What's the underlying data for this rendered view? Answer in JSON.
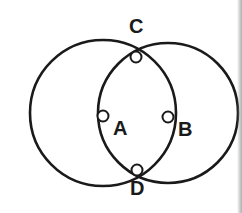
{
  "figure": {
    "background_color": "#ffffff",
    "stroke_color": "#1a1a1a",
    "marker_fill_color": "#ffffff",
    "label_color": "#1a1a1a",
    "width": 242,
    "height": 213
  },
  "circles": [
    {
      "name": "left-circle",
      "center_label": "A",
      "cx": 103,
      "cy": 113,
      "r": 73,
      "stroke_width": 2.6
    },
    {
      "name": "right-circle",
      "center_label": "B",
      "cx": 168,
      "cy": 113,
      "r": 70,
      "stroke_width": 2.6
    }
  ],
  "points": [
    {
      "id": "A",
      "label": "A",
      "x": 103,
      "y": 116,
      "marker_radius": 5.5,
      "label_x": 113,
      "label_y": 118,
      "description": "centre of left circle"
    },
    {
      "id": "B",
      "label": "B",
      "x": 168,
      "y": 117,
      "marker_radius": 5.5,
      "label_x": 178,
      "label_y": 119,
      "description": "centre of right circle"
    },
    {
      "id": "C",
      "label": "C",
      "x": 136,
      "y": 57,
      "marker_radius": 5.5,
      "label_x": 129,
      "label_y": 16,
      "description": "upper intersection of the two circles"
    },
    {
      "id": "D",
      "label": "D",
      "x": 137,
      "y": 170,
      "marker_radius": 5.5,
      "label_x": 130,
      "label_y": 178,
      "description": "lower intersection of the two circles"
    }
  ]
}
